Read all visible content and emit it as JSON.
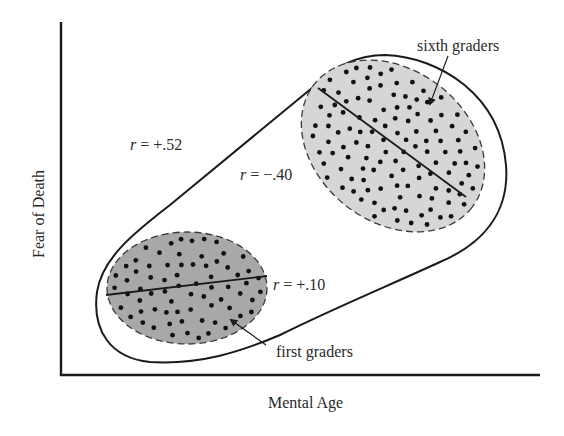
{
  "figure": {
    "x_axis_label": "Mental Age",
    "y_axis_label": "Fear of Death",
    "overall": {
      "r_symbol": "r",
      "r_value": "= +.52"
    },
    "groups": [
      {
        "name": "sixth graders",
        "r_symbol": "r",
        "r_value": "= −.40",
        "fill": "#d6d6d6",
        "slope": "negative"
      },
      {
        "name": "first graders",
        "r_symbol": "r",
        "r_value": "= +.10",
        "fill": "#a8a8a8",
        "slope": "slightly positive"
      }
    ],
    "colors": {
      "ink": "#1a1a1a",
      "light_fill": "#d6d6d6",
      "dark_fill": "#a8a8a8",
      "background": "#ffffff"
    }
  }
}
